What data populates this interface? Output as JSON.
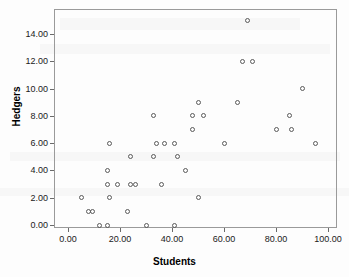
{
  "chart_data": {
    "type": "scatter",
    "title": "",
    "xlabel": "Students",
    "ylabel": "Hedgers",
    "xlim": [
      -4,
      104
    ],
    "ylim": [
      -0.9,
      15.6
    ],
    "grid": false,
    "legend": "none",
    "marker": "open-circle",
    "marker_color": "#5a5a5a",
    "xticks": [
      0,
      20,
      40,
      60,
      80,
      100
    ],
    "xtick_labels": [
      "0.00",
      "20.00",
      "40.00",
      "60.00",
      "80.00",
      "100.00"
    ],
    "yticks": [
      0,
      2,
      4,
      6,
      8,
      10,
      12,
      14
    ],
    "ytick_labels": [
      "0.00",
      "2.00",
      "4.00",
      "6.00",
      "8.00",
      "10.00",
      "12.00",
      "14.00"
    ],
    "n_points": 53,
    "points": [
      {
        "x": 5,
        "y": 2
      },
      {
        "x": 8,
        "y": 1
      },
      {
        "x": 9.5,
        "y": 1
      },
      {
        "x": 12,
        "y": 0
      },
      {
        "x": 15,
        "y": 0
      },
      {
        "x": 15,
        "y": 3
      },
      {
        "x": 15,
        "y": 4
      },
      {
        "x": 16,
        "y": 2
      },
      {
        "x": 16,
        "y": 6
      },
      {
        "x": 19,
        "y": 3
      },
      {
        "x": 23,
        "y": 1
      },
      {
        "x": 24,
        "y": 5
      },
      {
        "x": 24,
        "y": 3
      },
      {
        "x": 26,
        "y": 3
      },
      {
        "x": 30,
        "y": 0
      },
      {
        "x": 33,
        "y": 5
      },
      {
        "x": 33,
        "y": 8
      },
      {
        "x": 34,
        "y": 6
      },
      {
        "x": 36,
        "y": 3
      },
      {
        "x": 37,
        "y": 6
      },
      {
        "x": 41,
        "y": 0
      },
      {
        "x": 41,
        "y": 6
      },
      {
        "x": 42,
        "y": 5
      },
      {
        "x": 45,
        "y": 4
      },
      {
        "x": 48,
        "y": 7
      },
      {
        "x": 48,
        "y": 8
      },
      {
        "x": 50,
        "y": 9
      },
      {
        "x": 50,
        "y": 2
      },
      {
        "x": 52,
        "y": 8
      },
      {
        "x": 60,
        "y": 6
      },
      {
        "x": 65,
        "y": 9
      },
      {
        "x": 67,
        "y": 12
      },
      {
        "x": 69,
        "y": 15
      },
      {
        "x": 71,
        "y": 12
      },
      {
        "x": 80,
        "y": 7
      },
      {
        "x": 85,
        "y": 8
      },
      {
        "x": 86,
        "y": 7
      },
      {
        "x": 90,
        "y": 10
      },
      {
        "x": 95,
        "y": 6
      }
    ]
  }
}
